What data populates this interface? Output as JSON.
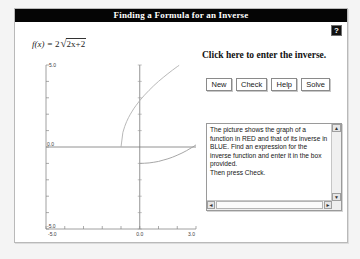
{
  "window": {
    "title": "Finding a Formula for an Inverse",
    "help_button": {
      "name": "help-question-button",
      "glyph": "?"
    }
  },
  "formula": {
    "lhs": "f(x) =",
    "coefficient": "2",
    "radical_sign": "√",
    "radicand": "2x+2",
    "plain": "f(x) = 2√(2x+2)"
  },
  "prompt": {
    "text": "Click here to enter the inverse."
  },
  "buttons": [
    {
      "name": "new-button",
      "label": "New"
    },
    {
      "name": "check-button",
      "label": "Check"
    },
    {
      "name": "help-button",
      "label": "Help"
    },
    {
      "name": "solve-button",
      "label": "Solve"
    }
  ],
  "instructions": {
    "text": "The picture shows the graph of a function in RED and that of its inverse in BLUE.  Find an expression for the inverse function and enter it in the box provided.\nThen press Check.",
    "scroll_up": "▲",
    "scroll_down": "▼",
    "scroll_left": "◄",
    "scroll_right": "►"
  },
  "chart_data": {
    "type": "line",
    "title": "",
    "xlabel": "",
    "ylabel": "",
    "xlim": [
      -5.0,
      3.0
    ],
    "ylim": [
      -5.0,
      5.0
    ],
    "grid": false,
    "legend": null,
    "axis_labels": {
      "y_top": "5.0",
      "y_origin": "0.0",
      "y_bottom": "-5.0",
      "x_left": "-5.0",
      "x_origin": "0.0",
      "x_right": "3.0"
    },
    "x_ticks": [
      -5.0,
      -4.0,
      -3.0,
      -2.0,
      -1.0,
      0.0,
      1.0,
      2.0,
      3.0
    ],
    "y_ticks": [
      -5.0,
      -4.0,
      -3.0,
      -2.0,
      -1.0,
      0.0,
      1.0,
      2.0,
      3.0,
      4.0,
      5.0
    ],
    "series": [
      {
        "name": "f(x) = 2*sqrt(2x+2)",
        "color": "#b0b0b0",
        "domain": [
          -1.0,
          2.1
        ],
        "points": [
          [
            -1.0,
            0.0
          ],
          [
            -0.9,
            0.89
          ],
          [
            -0.8,
            1.26
          ],
          [
            -0.7,
            1.55
          ],
          [
            -0.6,
            1.79
          ],
          [
            -0.5,
            2.0
          ],
          [
            -0.4,
            2.19
          ],
          [
            -0.3,
            2.37
          ],
          [
            -0.2,
            2.53
          ],
          [
            -0.1,
            2.68
          ],
          [
            0.0,
            2.83
          ],
          [
            0.25,
            3.16
          ],
          [
            0.5,
            3.46
          ],
          [
            0.75,
            3.74
          ],
          [
            1.0,
            4.0
          ],
          [
            1.25,
            4.24
          ],
          [
            1.5,
            4.47
          ],
          [
            1.75,
            4.69
          ],
          [
            2.0,
            4.9
          ],
          [
            2.1,
            4.98
          ]
        ]
      },
      {
        "name": "inverse: y = x^2/8 - 1",
        "color": "#9c9c9c",
        "domain": [
          0.0,
          3.0
        ],
        "points": [
          [
            0.0,
            -1.0
          ],
          [
            0.25,
            -0.99
          ],
          [
            0.5,
            -0.97
          ],
          [
            0.75,
            -0.93
          ],
          [
            1.0,
            -0.88
          ],
          [
            1.25,
            -0.8
          ],
          [
            1.5,
            -0.72
          ],
          [
            1.75,
            -0.62
          ],
          [
            2.0,
            -0.5
          ],
          [
            2.25,
            -0.37
          ],
          [
            2.5,
            -0.22
          ],
          [
            2.75,
            -0.05
          ],
          [
            2.83,
            0.0
          ],
          [
            3.0,
            0.13
          ]
        ]
      }
    ]
  }
}
